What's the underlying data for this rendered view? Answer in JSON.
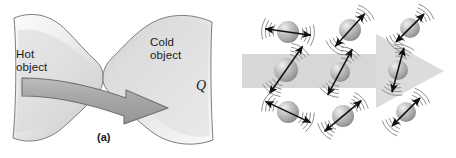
{
  "figure": {
    "width": 456,
    "height": 158,
    "background_color": "#ffffff"
  },
  "panel_a": {
    "caption": "(a)",
    "labels": {
      "hot_object": "Hot\nobject",
      "cold_object": "Cold\nobject",
      "heat_symbol": "Q"
    },
    "colors": {
      "object_fill_light": "#f2f2f2",
      "object_fill_mid": "#cfcfcf",
      "object_fill_dark": "#b4b4b4",
      "outline": "#6e6e6e",
      "arrow_fill": "#a9a9a9",
      "arrow_outline": "#6a6a6a",
      "text": "#1a1a1a"
    },
    "description": "Two shaded blob-shaped objects touching at a narrow neck; a thick curved gray arrow points from the hot object on the left to the cold object on the right, labeled Q."
  },
  "panel_b": {
    "caption": "(b)",
    "colors": {
      "band_fill": "#d6d6d6",
      "molecule_light": "#e8e8e8",
      "molecule_mid": "#b0b0b0",
      "molecule_dark": "#8a8a8a",
      "arrow_stroke": "#111111",
      "wave_stroke": "#8f8f8f",
      "text": "#1a1a1a"
    },
    "big_arrow": {
      "direction": "right",
      "label": ""
    },
    "molecules": [
      {
        "id": "m1",
        "row": "top",
        "cx": 60,
        "cy": 32,
        "r": 11,
        "arrow_angle_deg": 8,
        "arrow_len": 46,
        "waves": "both"
      },
      {
        "id": "m2",
        "row": "top",
        "cx": 122,
        "cy": 30,
        "r": 11,
        "arrow_angle_deg": 132,
        "arrow_len": 44,
        "waves": "both"
      },
      {
        "id": "m3",
        "row": "top",
        "cx": 182,
        "cy": 28,
        "r": 10,
        "arrow_angle_deg": 135,
        "arrow_len": 40,
        "waves": "both"
      },
      {
        "id": "m4",
        "row": "middle",
        "cx": 58,
        "cy": 70,
        "r": 12,
        "arrow_angle_deg": 125,
        "arrow_len": 58,
        "waves": "both"
      },
      {
        "id": "m5",
        "row": "middle",
        "cx": 112,
        "cy": 72,
        "r": 10,
        "arrow_angle_deg": 118,
        "arrow_len": 52,
        "waves": "both"
      },
      {
        "id": "m6",
        "row": "middle",
        "cx": 170,
        "cy": 70,
        "r": 10,
        "arrow_angle_deg": 105,
        "arrow_len": 46,
        "waves": "both"
      },
      {
        "id": "m7",
        "row": "bottom",
        "cx": 60,
        "cy": 112,
        "r": 11,
        "arrow_angle_deg": 25,
        "arrow_len": 50,
        "waves": "both"
      },
      {
        "id": "m8",
        "row": "bottom",
        "cx": 115,
        "cy": 116,
        "r": 11,
        "arrow_angle_deg": 140,
        "arrow_len": 48,
        "waves": "both"
      },
      {
        "id": "m9",
        "row": "bottom",
        "cx": 178,
        "cy": 112,
        "r": 10,
        "arrow_angle_deg": 135,
        "arrow_len": 40,
        "waves": "both"
      }
    ],
    "description": "Nine vibrating molecules drawn as shaded spheres with double-headed motion arrows and wave arcs; a wide light-gray arrow points to the right across the middle row indicating the direction of energy transfer."
  }
}
